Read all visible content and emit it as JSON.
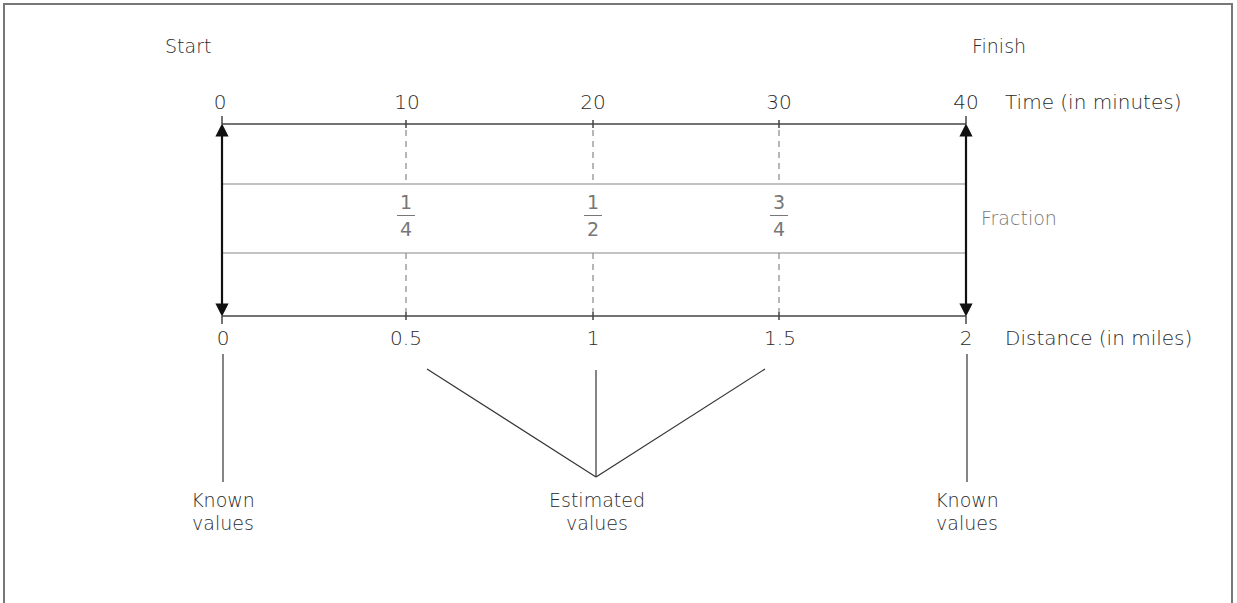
{
  "title_labels": {
    "start": "Start",
    "finish": "Finish"
  },
  "time_axis": {
    "label": "Time (in minutes)",
    "ticks": [
      "0",
      "10",
      "20",
      "30",
      "40"
    ]
  },
  "distance_axis": {
    "label": "Distance (in miles)",
    "ticks": [
      "0",
      "0.5",
      "1",
      "1.5",
      "2"
    ]
  },
  "fractions": [
    {
      "num": "1",
      "den": "4"
    },
    {
      "num": "1",
      "den": "2"
    },
    {
      "num": "3",
      "den": "4"
    }
  ],
  "fraction_label": "Fraction",
  "annotations": {
    "known_left": {
      "line1": "Known",
      "line2": "values"
    },
    "estimated": {
      "line1": "Estimated",
      "line2": "values"
    },
    "known_right": {
      "line1": "Known",
      "line2": "values"
    }
  },
  "colors": {
    "line": "#333333",
    "dashed": "#888888",
    "fraction_text": "#777777",
    "frame": "#777777"
  }
}
